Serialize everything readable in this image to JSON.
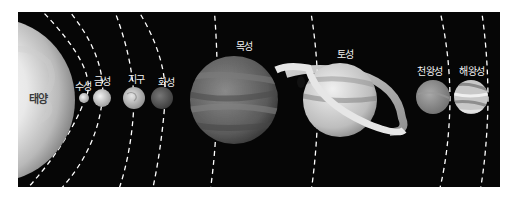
{
  "diagram": {
    "background": "#060606",
    "orbit_style": "white dashed arcs",
    "sun": {
      "label": "태양",
      "color": "#e8e8e8"
    },
    "planets": [
      {
        "id": "mercury",
        "label": "수성",
        "color": "#cfcfcf"
      },
      {
        "id": "venus",
        "label": "금성",
        "color": "#c9c9c9"
      },
      {
        "id": "earth",
        "label": "지구",
        "color": "#bdbdbd"
      },
      {
        "id": "mars",
        "label": "화성",
        "color": "#5e5e5e"
      },
      {
        "id": "jupiter",
        "label": "목성",
        "color": "#6a6a6a"
      },
      {
        "id": "saturn",
        "label": "토성",
        "color": "#cdcdcd"
      },
      {
        "id": "uranus",
        "label": "천왕성",
        "color": "#8c8c8c"
      },
      {
        "id": "neptune",
        "label": "해왕성",
        "color": "#bcbcbc"
      }
    ]
  }
}
